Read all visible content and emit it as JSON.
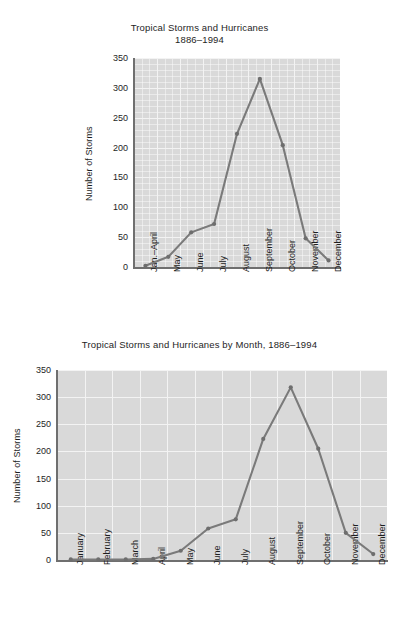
{
  "page": {
    "background_color": "#ffffff",
    "text_color": "#1e1e1e"
  },
  "figures": [
    {
      "id": "top",
      "title": "Tropical Storms and Hurricanes\n1886–1994",
      "ylabel": "Number of Storms"
    },
    {
      "id": "bottom",
      "title": "Tropical Storms and Hurricanes by Month, 1886–1994",
      "ylabel": "Number of Storms"
    }
  ],
  "chart_data": [
    {
      "type": "line",
      "title": "Tropical Storms and Hurricanes 1886–1994",
      "xlabel": "",
      "ylabel": "Number of Storms",
      "ylim": [
        0,
        350
      ],
      "yticks": [
        0,
        50,
        100,
        150,
        200,
        250,
        300,
        350
      ],
      "ytick_labels": [
        "0",
        "50",
        "100",
        "150",
        "200",
        "250",
        "300",
        "350"
      ],
      "grid": true,
      "minor_grid": true,
      "legend": "none",
      "plot_background": "#d9d9d9",
      "line_color": "#7a7a7a",
      "marker_color": "#6e6e6e",
      "categories": [
        "Jan.–April",
        "May",
        "June",
        "July",
        "August",
        "September",
        "October",
        "November",
        "December"
      ],
      "values": [
        2,
        17,
        58,
        72,
        223,
        315,
        204,
        48,
        11
      ]
    },
    {
      "type": "line",
      "title": "Tropical Storms and Hurricanes by Month, 1886–1994",
      "xlabel": "",
      "ylabel": "Number of Storms",
      "ylim": [
        0,
        350
      ],
      "yticks": [
        0,
        50,
        100,
        150,
        200,
        250,
        300,
        350
      ],
      "ytick_labels": [
        "0",
        "50",
        "100",
        "150",
        "200",
        "250",
        "300",
        "350"
      ],
      "grid": true,
      "minor_grid": false,
      "legend": "none",
      "plot_background": "#d9d9d9",
      "line_color": "#7a7a7a",
      "marker_color": "#6e6e6e",
      "categories": [
        "January",
        "February",
        "March",
        "April",
        "May",
        "June",
        "July",
        "August",
        "September",
        "October",
        "November",
        "December"
      ],
      "values": [
        1,
        1,
        1,
        2,
        17,
        58,
        75,
        223,
        318,
        205,
        50,
        11
      ]
    }
  ]
}
